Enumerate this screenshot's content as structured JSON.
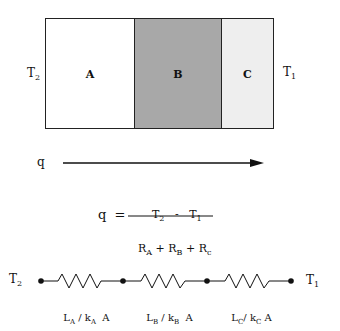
{
  "wall": {
    "left_temp": {
      "base": "T",
      "sub": "2"
    },
    "right_temp": {
      "base": "T",
      "sub": "1"
    },
    "layers": [
      {
        "label": "A",
        "fill": "#ffffff"
      },
      {
        "label": "B",
        "fill": "#a8a8a8"
      },
      {
        "label": "C",
        "fill": "#eeeeee"
      }
    ]
  },
  "flux": {
    "label": "q"
  },
  "equation": {
    "lhs": "q",
    "equals": "=",
    "numerator": {
      "t2": "T",
      "t2_sub": "2",
      "minus": "-",
      "t1": "T",
      "t1_sub": "1"
    },
    "denominator": {
      "r1": "R",
      "r1_sub": "A",
      "plus1": "+",
      "r2": "R",
      "r2_sub": "B",
      "plus2": "+",
      "r3": "R",
      "r3_sub": "c"
    }
  },
  "circuit": {
    "left_temp": {
      "base": "T",
      "sub": "2"
    },
    "right_temp": {
      "base": "T",
      "sub": "1"
    },
    "resistors": [
      {
        "L": "L",
        "L_sub": "A",
        "sep": "/",
        "k": "k",
        "k_sub": "A",
        "area": "A"
      },
      {
        "L": "L",
        "L_sub": "B",
        "sep": "/",
        "k": "k",
        "k_sub": "B",
        "area": "A"
      },
      {
        "L": "L",
        "L_sub": "C",
        "sep": "/",
        "k": "k",
        "k_sub": "C",
        "area": "A"
      }
    ]
  }
}
